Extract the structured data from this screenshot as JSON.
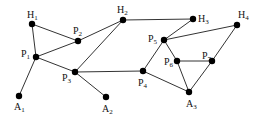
{
  "diagram": {
    "type": "graph",
    "nodes": [
      {
        "id": "H1",
        "base": "H",
        "sub": "1",
        "x": 32,
        "y": 24,
        "lx": 27,
        "ly": 18
      },
      {
        "id": "P2",
        "base": "P",
        "sub": "2",
        "x": 78,
        "y": 41,
        "lx": 73,
        "ly": 34
      },
      {
        "id": "P1",
        "base": "P",
        "sub": "1",
        "x": 36,
        "y": 57,
        "lx": 21,
        "ly": 57
      },
      {
        "id": "A1",
        "base": "A",
        "sub": "1",
        "x": 19,
        "y": 96,
        "lx": 14,
        "ly": 110
      },
      {
        "id": "H2",
        "base": "H",
        "sub": "2",
        "x": 123,
        "y": 20,
        "lx": 117,
        "ly": 13
      },
      {
        "id": "P3",
        "base": "P",
        "sub": "3",
        "x": 75,
        "y": 72,
        "lx": 62,
        "ly": 81
      },
      {
        "id": "A2",
        "base": "A",
        "sub": "2",
        "x": 106,
        "y": 97,
        "lx": 102,
        "ly": 112
      },
      {
        "id": "H3",
        "base": "H",
        "sub": "3",
        "x": 193,
        "y": 19,
        "lx": 198,
        "ly": 22
      },
      {
        "id": "H4",
        "base": "H",
        "sub": "4",
        "x": 237,
        "y": 25,
        "lx": 238,
        "ly": 18
      },
      {
        "id": "P5",
        "base": "P",
        "sub": "5",
        "x": 164,
        "y": 40,
        "lx": 148,
        "ly": 42
      },
      {
        "id": "P6",
        "base": "P",
        "sub": "6",
        "x": 177,
        "y": 61,
        "lx": 164,
        "ly": 65
      },
      {
        "id": "P7",
        "base": "P",
        "sub": "7",
        "x": 212,
        "y": 61,
        "lx": 202,
        "ly": 59
      },
      {
        "id": "P4",
        "base": "P",
        "sub": "4",
        "x": 143,
        "y": 71,
        "lx": 138,
        "ly": 86
      },
      {
        "id": "A3",
        "base": "A",
        "sub": "3",
        "x": 189,
        "y": 92,
        "lx": 186,
        "ly": 107
      }
    ],
    "edges": [
      [
        "H1",
        "P1"
      ],
      [
        "H1",
        "P2"
      ],
      [
        "P1",
        "P2"
      ],
      [
        "P1",
        "P3"
      ],
      [
        "P1",
        "A1"
      ],
      [
        "P2",
        "H2"
      ],
      [
        "H2",
        "P3"
      ],
      [
        "P3",
        "P4"
      ],
      [
        "P3",
        "A2"
      ],
      [
        "H2",
        "H3"
      ],
      [
        "H3",
        "P5"
      ],
      [
        "P5",
        "H4"
      ],
      [
        "P5",
        "P4"
      ],
      [
        "P5",
        "P6"
      ],
      [
        "P4",
        "A3"
      ],
      [
        "P6",
        "P7"
      ],
      [
        "P6",
        "A3"
      ],
      [
        "P7",
        "A3"
      ],
      [
        "H4",
        "P7"
      ]
    ],
    "colors": {
      "edge": "#333333",
      "node": "#000000",
      "background": "#ffffff"
    }
  }
}
